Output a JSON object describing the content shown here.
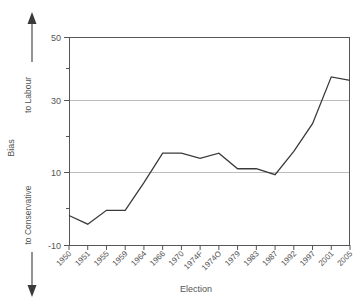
{
  "chart_data": {
    "type": "line",
    "title": "",
    "xlabel": "Election",
    "ylabel": "Bias",
    "categories": [
      "1950",
      "1951",
      "1955",
      "1959",
      "1964",
      "1966",
      "1970",
      "1974F",
      "1974O",
      "1979",
      "1983",
      "1987",
      "1992",
      "1997",
      "2001",
      "2005"
    ],
    "values": [
      -1.5,
      -4.0,
      0.0,
      0.0,
      8.0,
      16.5,
      16.5,
      15.0,
      16.5,
      12.0,
      12.0,
      10.3,
      17.0,
      25.0,
      38.5,
      37.5
    ],
    "series": [
      {
        "name": "Bias",
        "values": [
          -1.5,
          -4.0,
          0.0,
          0.0,
          8.0,
          16.5,
          16.5,
          15.0,
          16.5,
          12.0,
          12.0,
          10.3,
          17.0,
          25.0,
          38.5,
          37.5
        ]
      }
    ],
    "ylim": [
      -10,
      50
    ],
    "ytick_labels": [
      "50",
      "30",
      "10",
      "-10"
    ],
    "ytick_values": [
      50,
      30,
      10,
      -10
    ],
    "yminor_values": [
      40,
      20,
      0
    ],
    "gridlines": [
      30,
      10
    ],
    "grid": true,
    "legend": "none",
    "line_color": "#3a3a3a",
    "grid_color": "#bdbdbd",
    "axis_color": "#555555"
  },
  "annotations": {
    "direction_up_label": "to Labour",
    "direction_down_label": "to Conservative",
    "up_arrow_icon": "arrow-up-icon",
    "down_arrow_icon": "arrow-down-icon"
  },
  "axes": {
    "y_axis_title": "Bias",
    "x_axis_title": "Election"
  }
}
